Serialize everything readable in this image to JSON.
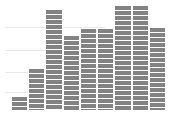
{
  "chart_data": {
    "type": "bar",
    "title": "",
    "subtitle": "",
    "xlabel": "",
    "ylabel": "",
    "categories": [
      "1",
      "2",
      "3",
      "4",
      "5",
      "6",
      "7",
      "8",
      "9"
    ],
    "values": [
      14,
      42,
      101,
      75,
      82,
      82,
      105,
      105,
      83
    ],
    "ylim": [
      0,
      110
    ],
    "xlim": [
      0,
      9
    ],
    "grid": true,
    "gridlines_y": [
      18,
      38,
      60,
      83
    ],
    "legend": null,
    "legend_position": "none",
    "annotations": [],
    "tick_labels_x": [],
    "tick_labels_y": [],
    "series": [
      {
        "name": "series-1",
        "values": [
          14,
          42,
          101,
          75,
          82,
          82,
          105,
          105,
          83
        ]
      }
    ],
    "style": {
      "bar_fill": "#828282",
      "bar_hatch": "horizontal-lines",
      "bar_hatch_color": "#ffffff",
      "bar_edge_color": "#ffffff",
      "grid_color": "#e8e8e8",
      "background": "#ffffff"
    },
    "geometry": {
      "baseline_y": 110,
      "plot_left": 11,
      "plot_width": 155,
      "grid_left": 5,
      "bar_tops": [
        96,
        68,
        9,
        35,
        28,
        28,
        5,
        5,
        27
      ],
      "grid_y": [
        27,
        50,
        72,
        92
      ],
      "grid_right": [
        69,
        58,
        48,
        40
      ]
    }
  }
}
